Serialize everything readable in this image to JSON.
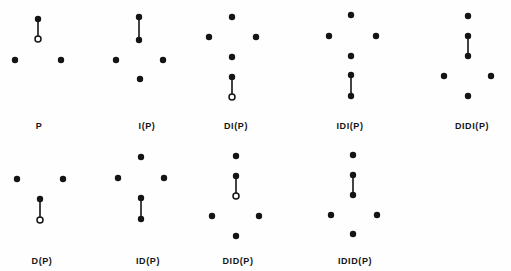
{
  "figure": {
    "background_color": "#fefefe",
    "ink_color": "#141414",
    "dot_radius": 3.2,
    "open_dot_radius": 3.0,
    "open_dot_inner_radius": 1.5,
    "edge_width": 1.6,
    "width": 511,
    "height": 271,
    "panels": [
      {
        "id": "panel-p",
        "label": "P",
        "label_x": 39,
        "label_y": 121,
        "nodes": [
          {
            "name": "apex-filled",
            "x": 38,
            "y": 19,
            "type": "filled"
          },
          {
            "name": "lower-open",
            "x": 38,
            "y": 39,
            "type": "open"
          },
          {
            "name": "left-filled",
            "x": 15,
            "y": 60,
            "type": "filled"
          },
          {
            "name": "right-filled",
            "x": 61,
            "y": 60,
            "type": "filled"
          }
        ],
        "edges": [
          {
            "from": 0,
            "to": 1
          }
        ]
      },
      {
        "id": "panel-i-p",
        "label": "I(P)",
        "label_x": 147,
        "label_y": 121,
        "nodes": [
          {
            "name": "apex-filled",
            "x": 139,
            "y": 17,
            "type": "filled"
          },
          {
            "name": "upper-mid-filled",
            "x": 139,
            "y": 40,
            "type": "filled"
          },
          {
            "name": "left-filled",
            "x": 116,
            "y": 60,
            "type": "filled"
          },
          {
            "name": "right-filled",
            "x": 163,
            "y": 60,
            "type": "filled"
          },
          {
            "name": "bottom-filled",
            "x": 140,
            "y": 79,
            "type": "filled"
          }
        ],
        "edges": [
          {
            "from": 0,
            "to": 1
          }
        ]
      },
      {
        "id": "panel-di-p",
        "label": "DI(P)",
        "label_x": 236,
        "label_y": 121,
        "nodes": [
          {
            "name": "apex-filled",
            "x": 232,
            "y": 17,
            "type": "filled"
          },
          {
            "name": "left-filled",
            "x": 209,
            "y": 37,
            "type": "filled"
          },
          {
            "name": "right-filled",
            "x": 256,
            "y": 37,
            "type": "filled"
          },
          {
            "name": "center-filled",
            "x": 232,
            "y": 57,
            "type": "filled"
          },
          {
            "name": "lower-filled",
            "x": 232,
            "y": 77,
            "type": "filled"
          },
          {
            "name": "bottom-open",
            "x": 232,
            "y": 97,
            "type": "open"
          }
        ],
        "edges": [
          {
            "from": 4,
            "to": 5
          }
        ]
      },
      {
        "id": "panel-idi-p",
        "label": "IDI(P)",
        "label_x": 350,
        "label_y": 121,
        "nodes": [
          {
            "name": "apex-filled",
            "x": 351,
            "y": 15,
            "type": "filled"
          },
          {
            "name": "left-filled",
            "x": 329,
            "y": 36,
            "type": "filled"
          },
          {
            "name": "right-filled",
            "x": 376,
            "y": 36,
            "type": "filled"
          },
          {
            "name": "center-filled",
            "x": 351,
            "y": 56,
            "type": "filled"
          },
          {
            "name": "lower-filled",
            "x": 351,
            "y": 75,
            "type": "filled"
          },
          {
            "name": "bottom-filled",
            "x": 351,
            "y": 96,
            "type": "filled"
          }
        ],
        "edges": [
          {
            "from": 4,
            "to": 5
          }
        ]
      },
      {
        "id": "panel-didi-p",
        "label": "DIDI(P)",
        "label_x": 472,
        "label_y": 121,
        "nodes": [
          {
            "name": "apex-filled",
            "x": 468,
            "y": 16,
            "type": "filled"
          },
          {
            "name": "upper-mid-filled",
            "x": 468,
            "y": 36,
            "type": "filled"
          },
          {
            "name": "lower-mid-filled",
            "x": 468,
            "y": 56,
            "type": "filled"
          },
          {
            "name": "left-filled",
            "x": 444,
            "y": 76,
            "type": "filled"
          },
          {
            "name": "right-filled",
            "x": 491,
            "y": 76,
            "type": "filled"
          },
          {
            "name": "bottom-filled",
            "x": 468,
            "y": 96,
            "type": "filled"
          }
        ],
        "edges": [
          {
            "from": 1,
            "to": 2
          }
        ]
      },
      {
        "id": "panel-d-p",
        "label": "D(P)",
        "label_x": 42,
        "label_y": 256,
        "nodes": [
          {
            "name": "left-filled",
            "x": 17,
            "y": 179,
            "type": "filled"
          },
          {
            "name": "right-filled",
            "x": 63,
            "y": 179,
            "type": "filled"
          },
          {
            "name": "center-filled",
            "x": 40,
            "y": 199,
            "type": "filled"
          },
          {
            "name": "bottom-open",
            "x": 40,
            "y": 220,
            "type": "open"
          }
        ],
        "edges": [
          {
            "from": 2,
            "to": 3
          }
        ]
      },
      {
        "id": "panel-id-p",
        "label": "ID(P)",
        "label_x": 148,
        "label_y": 256,
        "nodes": [
          {
            "name": "apex-filled",
            "x": 141,
            "y": 157,
            "type": "filled"
          },
          {
            "name": "left-filled",
            "x": 118,
            "y": 178,
            "type": "filled"
          },
          {
            "name": "right-filled",
            "x": 164,
            "y": 178,
            "type": "filled"
          },
          {
            "name": "center-filled",
            "x": 141,
            "y": 198,
            "type": "filled"
          },
          {
            "name": "bottom-filled",
            "x": 141,
            "y": 219,
            "type": "filled"
          }
        ],
        "edges": [
          {
            "from": 3,
            "to": 4
          }
        ]
      },
      {
        "id": "panel-did-p",
        "label": "DID(P)",
        "label_x": 238,
        "label_y": 256,
        "nodes": [
          {
            "name": "apex-filled",
            "x": 236,
            "y": 156,
            "type": "filled"
          },
          {
            "name": "upper-mid-filled",
            "x": 236,
            "y": 176,
            "type": "filled"
          },
          {
            "name": "mid-open",
            "x": 236,
            "y": 196,
            "type": "open"
          },
          {
            "name": "left-filled",
            "x": 212,
            "y": 216,
            "type": "filled"
          },
          {
            "name": "right-filled",
            "x": 259,
            "y": 216,
            "type": "filled"
          },
          {
            "name": "bottom-filled",
            "x": 236,
            "y": 236,
            "type": "filled"
          }
        ],
        "edges": [
          {
            "from": 1,
            "to": 2
          }
        ]
      },
      {
        "id": "panel-idid-p",
        "label": "IDID(P)",
        "label_x": 355,
        "label_y": 256,
        "nodes": [
          {
            "name": "apex-filled",
            "x": 353,
            "y": 155,
            "type": "filled"
          },
          {
            "name": "upper-mid-filled",
            "x": 353,
            "y": 175,
            "type": "filled"
          },
          {
            "name": "lower-mid-filled",
            "x": 353,
            "y": 195,
            "type": "filled"
          },
          {
            "name": "left-filled",
            "x": 331,
            "y": 215,
            "type": "filled"
          },
          {
            "name": "right-filled",
            "x": 377,
            "y": 215,
            "type": "filled"
          },
          {
            "name": "bottom-filled",
            "x": 353,
            "y": 234,
            "type": "filled"
          }
        ],
        "edges": [
          {
            "from": 1,
            "to": 2
          }
        ]
      }
    ]
  }
}
